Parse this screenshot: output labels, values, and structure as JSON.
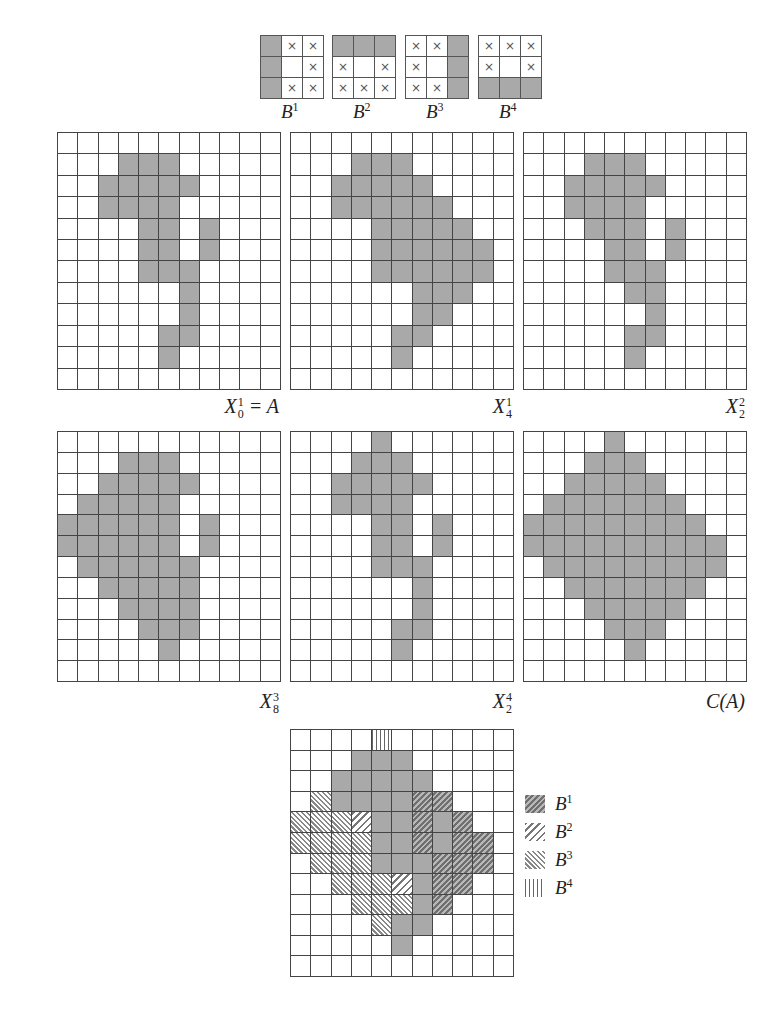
{
  "structuring_elements": [
    {
      "name": "B",
      "sup": "1",
      "cells": [
        "F",
        "X",
        "X",
        "F",
        "",
        "X",
        "F",
        "X",
        "X"
      ]
    },
    {
      "name": "B",
      "sup": "2",
      "cells": [
        "F",
        "F",
        "F",
        "X",
        "",
        "X",
        "X",
        "X",
        "X"
      ]
    },
    {
      "name": "B",
      "sup": "3",
      "cells": [
        "X",
        "X",
        "F",
        "X",
        "",
        "F",
        "X",
        "X",
        "F"
      ]
    },
    {
      "name": "B",
      "sup": "4",
      "cells": [
        "X",
        "X",
        "X",
        "X",
        "",
        "X",
        "F",
        "F",
        "F"
      ]
    }
  ],
  "cross_glyph": "×",
  "grid_size": {
    "cols": 11,
    "rows": 12
  },
  "grids": [
    {
      "id": "X01",
      "label_main": "X",
      "label_sub": "0",
      "label_sup": "1",
      "label_suffix": " = A",
      "rows": [
        [],
        [
          3,
          4,
          5
        ],
        [
          2,
          3,
          4,
          5,
          6
        ],
        [
          2,
          3,
          4,
          5
        ],
        [
          4,
          5,
          7
        ],
        [
          4,
          5,
          7
        ],
        [
          4,
          5,
          6
        ],
        [
          6
        ],
        [
          6
        ],
        [
          5,
          6
        ],
        [
          5
        ],
        []
      ]
    },
    {
      "id": "X41",
      "label_main": "X",
      "label_sub": "4",
      "label_sup": "1",
      "label_suffix": "",
      "rows": [
        [],
        [
          3,
          4,
          5
        ],
        [
          2,
          3,
          4,
          5,
          6
        ],
        [
          2,
          3,
          4,
          5,
          6,
          7
        ],
        [
          4,
          5,
          6,
          7,
          8
        ],
        [
          4,
          5,
          6,
          7,
          8,
          9
        ],
        [
          4,
          5,
          6,
          7,
          8,
          9
        ],
        [
          6,
          7,
          8
        ],
        [
          6,
          7
        ],
        [
          5,
          6
        ],
        [
          5
        ],
        []
      ]
    },
    {
      "id": "X22",
      "label_main": "X",
      "label_sub": "2",
      "label_sup": "2",
      "label_suffix": "",
      "rows": [
        [],
        [
          3,
          4,
          5
        ],
        [
          2,
          3,
          4,
          5,
          6
        ],
        [
          2,
          3,
          4,
          5
        ],
        [
          3,
          4,
          5,
          7
        ],
        [
          4,
          5,
          7
        ],
        [
          4,
          5,
          6
        ],
        [
          5,
          6
        ],
        [
          6
        ],
        [
          5,
          6
        ],
        [
          5
        ],
        []
      ]
    },
    {
      "id": "X83",
      "label_main": "X",
      "label_sub": "8",
      "label_sup": "3",
      "label_suffix": "",
      "rows": [
        [],
        [
          3,
          4,
          5
        ],
        [
          2,
          3,
          4,
          5,
          6
        ],
        [
          1,
          2,
          3,
          4,
          5
        ],
        [
          0,
          1,
          2,
          3,
          4,
          5,
          7
        ],
        [
          0,
          1,
          2,
          3,
          4,
          5,
          7
        ],
        [
          1,
          2,
          3,
          4,
          5,
          6
        ],
        [
          2,
          3,
          4,
          5,
          6
        ],
        [
          3,
          4,
          5,
          6
        ],
        [
          4,
          5,
          6
        ],
        [
          5
        ],
        []
      ]
    },
    {
      "id": "X24",
      "label_main": "X",
      "label_sub": "2",
      "label_sup": "4",
      "label_suffix": "",
      "rows": [
        [
          4
        ],
        [
          3,
          4,
          5
        ],
        [
          2,
          3,
          4,
          5,
          6
        ],
        [
          2,
          3,
          4,
          5
        ],
        [
          4,
          5,
          7
        ],
        [
          4,
          5,
          7
        ],
        [
          4,
          5,
          6
        ],
        [
          6
        ],
        [
          6
        ],
        [
          5,
          6
        ],
        [
          5
        ],
        []
      ]
    },
    {
      "id": "CA",
      "label_main": "C(A)",
      "label_sub": "",
      "label_sup": "",
      "label_suffix": "",
      "rows": [
        [
          4
        ],
        [
          3,
          4,
          5
        ],
        [
          2,
          3,
          4,
          5,
          6
        ],
        [
          1,
          2,
          3,
          4,
          5,
          6,
          7
        ],
        [
          0,
          1,
          2,
          3,
          4,
          5,
          6,
          7,
          8
        ],
        [
          0,
          1,
          2,
          3,
          4,
          5,
          6,
          7,
          8,
          9
        ],
        [
          1,
          2,
          3,
          4,
          5,
          6,
          7,
          8,
          9
        ],
        [
          2,
          3,
          4,
          5,
          6,
          7,
          8
        ],
        [
          3,
          4,
          5,
          6,
          7
        ],
        [
          4,
          5,
          6
        ],
        [
          5
        ],
        []
      ]
    }
  ],
  "composite": {
    "legend_codes": {
      "A": "original set A (gray)",
      "1": "B1",
      "2": "B2",
      "3": "B3",
      "4": "B4"
    },
    "rows": [
      "....4......",
      "...AAA.....",
      "..AAAAA....",
      ".3AAAA11...",
      "3332AA1A1..",
      "3333AA1A11.",
      ".333AAA111.",
      "..3332A11..",
      "...333A1...",
      "....3AA....",
      ".....A.....",
      "..........."
    ]
  },
  "legend": [
    {
      "pattern": "p1",
      "name": "B",
      "sup": "1"
    },
    {
      "pattern": "p2",
      "name": "B",
      "sup": "2"
    },
    {
      "pattern": "p3",
      "name": "B",
      "sup": "3"
    },
    {
      "pattern": "p4",
      "name": "B",
      "sup": "4"
    }
  ],
  "colors": {
    "fill": "#a9a9a9",
    "grid_line": "#444444",
    "background": "#ffffff"
  }
}
